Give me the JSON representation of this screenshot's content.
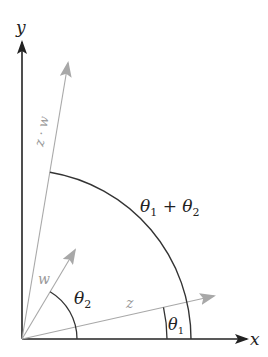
{
  "diagram": {
    "colors": {
      "axis": "#222222",
      "vector": "#a8a8a8",
      "arc": "#333333",
      "label_dark": "#222222",
      "label_gray": "#999999"
    },
    "axes": {
      "x_label": "x",
      "y_label": "y"
    },
    "vectors": [
      {
        "name": "z",
        "label": "z",
        "angle_deg": 12.6
      },
      {
        "name": "w",
        "label": "w",
        "angle_deg": 59.2
      },
      {
        "name": "z·w",
        "label": "z · w",
        "angle_deg": 80.5
      }
    ],
    "angles": [
      {
        "name": "theta1",
        "symbol": "θ",
        "subscript": "1"
      },
      {
        "name": "theta2",
        "symbol": "θ",
        "subscript": "2"
      },
      {
        "name": "theta-sum",
        "symbol1": "θ",
        "sub1": "1",
        "op": " + ",
        "symbol2": "θ",
        "sub2": "2"
      }
    ]
  }
}
